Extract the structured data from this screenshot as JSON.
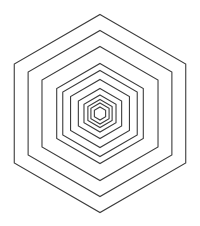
{
  "figure": {
    "background": "#ffffff",
    "stroke_color": "#3c3c3c",
    "center": [
      100,
      113.5
    ],
    "hexagon_count": 11,
    "radii": [
      99,
      83,
      67,
      50,
      43,
      34,
      25,
      18.5,
      14,
      10.5,
      6.5
    ]
  }
}
